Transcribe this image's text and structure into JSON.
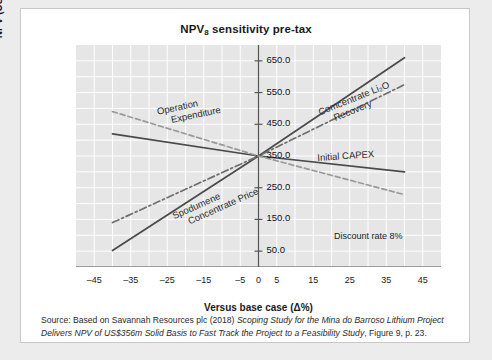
{
  "chart_data": {
    "type": "line",
    "title": "NPV",
    "title_sub": "8",
    "title_rest": " sensitivity pre-tax",
    "title_full": "NPV8 sensitivity pre-tax",
    "xlabel": "Versus base case (Δ%)",
    "ylabel": "NPV (US$m)",
    "xlim": [
      -50,
      50
    ],
    "ylim": [
      0,
      700
    ],
    "xticks": [
      -45,
      -35,
      -25,
      -15,
      -5,
      0,
      5,
      15,
      25,
      35,
      45
    ],
    "xticklabels": [
      "–45",
      "–35",
      "–25",
      "–15",
      "–5",
      "0",
      "5",
      "15",
      "25",
      "35",
      "45"
    ],
    "yticks": [
      50,
      150,
      250,
      350,
      450,
      550,
      650
    ],
    "yticklabels": [
      "50.0",
      "150.0",
      "250.0",
      "350.0",
      "450.0",
      "550.0",
      "650.0"
    ],
    "grid": true,
    "legend": "none (inline annotations)",
    "base_case_npv": 350,
    "series": [
      {
        "name": "Spodumene Concentrate Price",
        "style": "solid",
        "color": "#4a4a4a",
        "x": [
          -40,
          0,
          40
        ],
        "y": [
          52,
          350,
          660
        ]
      },
      {
        "name": "Comcentrate Li2O Recovery",
        "label": "Comcentrate Li₂O Recovery",
        "style": "dash-dot",
        "color": "#6e6e6e",
        "x": [
          -40,
          0,
          40
        ],
        "y": [
          140,
          350,
          575
        ]
      },
      {
        "name": "Initial CAPEX",
        "style": "solid",
        "color": "#4a4a4a",
        "x": [
          -40,
          0,
          40
        ],
        "y": [
          420,
          350,
          300
        ]
      },
      {
        "name": "Operation Expenditure",
        "style": "dashed",
        "color": "#9a9a9a",
        "x": [
          -40,
          0,
          40
        ],
        "y": [
          490,
          350,
          228
        ]
      }
    ],
    "annotations": [
      {
        "text_line1": "Operation",
        "text_line2": "Expenditure",
        "x": -28,
        "y": 505,
        "rotation": -12
      },
      {
        "text_line1": "Comcentrate Li₂O",
        "text_line2": "Recovery",
        "x": 16,
        "y": 500,
        "rotation": -22
      },
      {
        "text_line1": "Initial CAPEX",
        "text_line2": "",
        "x": 16,
        "y": 360,
        "rotation": -4
      },
      {
        "text_line1": "Spodumene",
        "text_line2": "Concentrate Price",
        "x": -24,
        "y": 175,
        "rotation": -24
      }
    ],
    "note": "Discount rate 8%"
  },
  "caption": {
    "prefix": "Source: Based on Savannah Resources plc (2018) ",
    "work_title": "Scoping Study for the Mina do Barroso Lithium Project Delivers NPV of US$356m Solid Basis to Fast Track the Project to a Feasibility Study",
    "suffix": ", Figure 9, p. 23."
  },
  "colors": {
    "page_background": "#ececec",
    "card_background": "#ffffff",
    "plot_background": "#e6e6e6",
    "gridline": "#ffffff",
    "axis": "#555555",
    "text": "#1a1a1a"
  }
}
